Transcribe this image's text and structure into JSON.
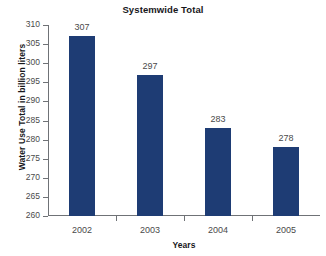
{
  "chart_data": {
    "type": "bar",
    "title": "Systemwide Total",
    "xlabel": "Years",
    "ylabel": "Water Use Total in billion liters",
    "categories": [
      "2002",
      "2003",
      "2004",
      "2005"
    ],
    "values": [
      307,
      297,
      283,
      278
    ],
    "value_labels": [
      "307",
      "297",
      "283",
      "278"
    ],
    "ylim": [
      260,
      310
    ],
    "ytick_step": 5,
    "ytick_labels": [
      "310",
      "305",
      "300",
      "295",
      "290",
      "285",
      "280",
      "275",
      "270",
      "265",
      "260"
    ],
    "grid": false,
    "legend": false,
    "legend_position": "none",
    "series": [
      {
        "name": "Systemwide Total",
        "values": [
          307,
          297,
          283,
          278
        ],
        "color": "#1e3c74"
      }
    ]
  },
  "style": {
    "bar_color": "#1e3c74",
    "axis_color": "#6f7276",
    "tick_text_color": "#4a4a4a",
    "title_color": "#17171b",
    "background": "#ffffff"
  }
}
